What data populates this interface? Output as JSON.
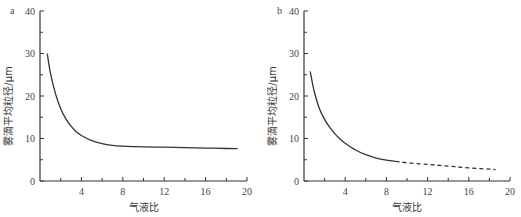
{
  "chart_data": [
    {
      "type": "line",
      "panel_label": "a",
      "title": "",
      "xlabel": "气液比",
      "ylabel": "雾滴平均粒径/μm",
      "xlim": [
        0,
        20
      ],
      "ylim": [
        0,
        40
      ],
      "xticks": [
        4,
        8,
        12,
        16,
        20
      ],
      "yticks": [
        0,
        10,
        20,
        30,
        40
      ],
      "grid": false,
      "series": [
        {
          "name": "solid",
          "style": "solid",
          "x": [
            0.7,
            1.0,
            1.5,
            2.0,
            2.5,
            3.0,
            3.5,
            4.0,
            5.0,
            6.0,
            7.0,
            8.0,
            9.0,
            10.0,
            12.0,
            14.0,
            16.0,
            18.0,
            19.1
          ],
          "y": [
            30.0,
            25.5,
            20.5,
            17.0,
            14.6,
            12.9,
            11.6,
            10.7,
            9.5,
            8.8,
            8.4,
            8.2,
            8.1,
            8.05,
            7.95,
            7.85,
            7.75,
            7.65,
            7.6
          ]
        }
      ]
    },
    {
      "type": "line",
      "panel_label": "b",
      "title": "",
      "xlabel": "气液比",
      "ylabel": "雾滴平均粒径/μm",
      "xlim": [
        0,
        20
      ],
      "ylim": [
        0,
        40
      ],
      "xticks": [
        4,
        8,
        12,
        16,
        20
      ],
      "yticks": [
        0,
        10,
        20,
        30,
        40
      ],
      "grid": false,
      "series": [
        {
          "name": "measured",
          "style": "solid",
          "x": [
            0.6,
            1.0,
            1.5,
            2.0,
            2.5,
            3.0,
            3.5,
            4.0,
            5.0,
            6.0,
            7.0,
            8.0,
            8.9
          ],
          "y": [
            25.8,
            21.0,
            17.0,
            14.5,
            12.6,
            11.1,
            9.9,
            8.9,
            7.3,
            6.2,
            5.4,
            4.9,
            4.6
          ]
        },
        {
          "name": "extrapolated",
          "style": "dashed",
          "x": [
            8.9,
            10.0,
            12.0,
            14.0,
            16.0,
            18.6
          ],
          "y": [
            4.6,
            4.3,
            3.9,
            3.5,
            3.1,
            2.7
          ]
        }
      ]
    }
  ],
  "charts": [
    {
      "panel_label": "a",
      "xlabel": "气液比",
      "ylabel": "雾滴平均粒径/μm"
    },
    {
      "panel_label": "b",
      "xlabel": "气液比",
      "ylabel": "雾滴平均粒径/μm"
    }
  ]
}
